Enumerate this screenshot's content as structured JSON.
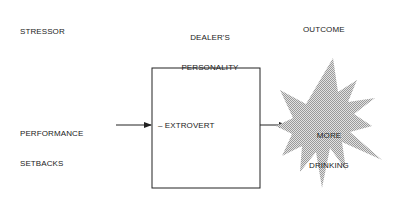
{
  "headers": {
    "stressor": "STRESSOR",
    "personality_line1": "DEALER'S",
    "personality_line2": "PERSONALITY",
    "outcome": "OUTCOME"
  },
  "stressor": {
    "line1": "PERFORMANCE",
    "line2": "SETBACKS"
  },
  "personality": {
    "trait": "– EXTROVERT"
  },
  "outcome": {
    "line1": "MORE",
    "line2": "DRINKING"
  },
  "colors": {
    "line": "#222222",
    "burst_fill": "#c8c8c8"
  }
}
